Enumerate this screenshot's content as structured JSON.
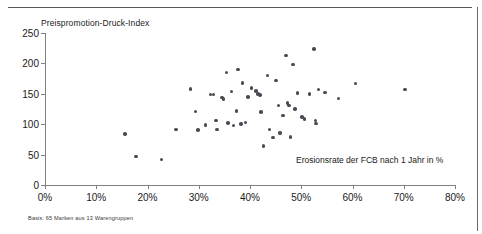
{
  "chart_data": {
    "type": "scatter",
    "title": "",
    "ylabel": "Preispromotion-Druck-Index",
    "xlabel": "Erosionsrate der FCB nach 1 Jahr in %",
    "xlim": [
      0,
      80
    ],
    "ylim": [
      0,
      250
    ],
    "xticks": [
      "0%",
      "10%",
      "20%",
      "30%",
      "40%",
      "50%",
      "60%",
      "70%",
      "80%"
    ],
    "xtick_values": [
      0,
      10,
      20,
      30,
      40,
      50,
      60,
      70,
      80
    ],
    "yticks": [
      "0",
      "50",
      "100",
      "150",
      "200",
      "250"
    ],
    "ytick_values": [
      0,
      50,
      100,
      150,
      200,
      250
    ],
    "grid": false,
    "legend": null,
    "marker_color": "#4a4a55",
    "axis_color": "#808080",
    "points": [
      {
        "x": 15.6,
        "y": 84
      },
      {
        "x": 17.8,
        "y": 47
      },
      {
        "x": 22.7,
        "y": 42
      },
      {
        "x": 25.6,
        "y": 91
      },
      {
        "x": 28.4,
        "y": 158
      },
      {
        "x": 29.4,
        "y": 121
      },
      {
        "x": 29.8,
        "y": 90
      },
      {
        "x": 31.3,
        "y": 99
      },
      {
        "x": 32.3,
        "y": 149
      },
      {
        "x": 32.9,
        "y": 149
      },
      {
        "x": 33.4,
        "y": 106
      },
      {
        "x": 33.6,
        "y": 91
      },
      {
        "x": 34.5,
        "y": 144
      },
      {
        "x": 34.8,
        "y": 141
      },
      {
        "x": 35.4,
        "y": 185
      },
      {
        "x": 35.7,
        "y": 102
      },
      {
        "x": 36.4,
        "y": 154
      },
      {
        "x": 36.8,
        "y": 98
      },
      {
        "x": 37.4,
        "y": 122
      },
      {
        "x": 37.7,
        "y": 190
      },
      {
        "x": 38.2,
        "y": 100
      },
      {
        "x": 38.5,
        "y": 168
      },
      {
        "x": 39.1,
        "y": 103
      },
      {
        "x": 39.6,
        "y": 145
      },
      {
        "x": 40.3,
        "y": 160
      },
      {
        "x": 41.2,
        "y": 155
      },
      {
        "x": 41.6,
        "y": 150
      },
      {
        "x": 41.9,
        "y": 148
      },
      {
        "x": 42.2,
        "y": 120
      },
      {
        "x": 42.6,
        "y": 64
      },
      {
        "x": 43.4,
        "y": 180
      },
      {
        "x": 43.8,
        "y": 91
      },
      {
        "x": 44.5,
        "y": 78
      },
      {
        "x": 45.1,
        "y": 172
      },
      {
        "x": 45.6,
        "y": 131
      },
      {
        "x": 45.9,
        "y": 86
      },
      {
        "x": 46.4,
        "y": 114
      },
      {
        "x": 47.0,
        "y": 213
      },
      {
        "x": 47.3,
        "y": 135
      },
      {
        "x": 47.6,
        "y": 131
      },
      {
        "x": 47.9,
        "y": 79
      },
      {
        "x": 48.4,
        "y": 198
      },
      {
        "x": 48.8,
        "y": 125
      },
      {
        "x": 49.3,
        "y": 151
      },
      {
        "x": 50.1,
        "y": 112
      },
      {
        "x": 50.6,
        "y": 109
      },
      {
        "x": 51.6,
        "y": 150
      },
      {
        "x": 52.5,
        "y": 224
      },
      {
        "x": 52.8,
        "y": 106
      },
      {
        "x": 52.9,
        "y": 101
      },
      {
        "x": 53.4,
        "y": 157
      },
      {
        "x": 54.6,
        "y": 152
      },
      {
        "x": 57.3,
        "y": 142
      },
      {
        "x": 60.6,
        "y": 167
      },
      {
        "x": 70.2,
        "y": 157
      }
    ],
    "footnote": "Basis: 65 Marken aus 13 Warengruppen"
  }
}
